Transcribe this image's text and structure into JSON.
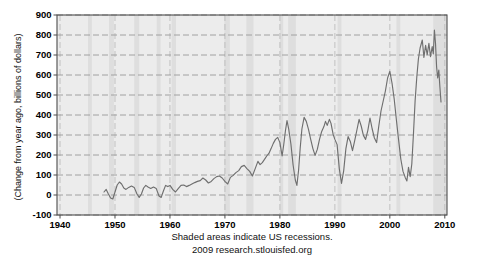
{
  "chart_data": {
    "type": "line",
    "title": "",
    "xlabel": "",
    "ylabel": "(Change from year ago, billions of dollars)",
    "note": "Shaded areas indicate US recessions.",
    "source": "2009 research.stlouisfed.org",
    "xlim": [
      1939.45,
      2010.4
    ],
    "ylim": [
      -100,
      900
    ],
    "x_ticks": [
      1940,
      1950,
      1960,
      1970,
      1980,
      1990,
      2000,
      2010
    ],
    "y_ticks": [
      -100,
      0,
      100,
      200,
      300,
      400,
      500,
      600,
      700,
      800,
      900
    ],
    "grid": "dashed horizontal and vertical at decades",
    "legend": "none",
    "colors": {
      "plot_bg": "#ececec",
      "recession_band": "#dedede",
      "h_gridline": "#9a9a9a",
      "v_gridline": "#bcbcbc",
      "frame": "#4d4d4d",
      "series": "#6f6f6f",
      "text": "#000000"
    },
    "recessions": [
      [
        1945.1,
        1945.8
      ],
      [
        1948.9,
        1949.8
      ],
      [
        1953.5,
        1954.4
      ],
      [
        1957.6,
        1958.3
      ],
      [
        1960.3,
        1961.1
      ],
      [
        1969.9,
        1970.9
      ],
      [
        1973.9,
        1975.2
      ],
      [
        1980.0,
        1980.6
      ],
      [
        1981.5,
        1982.9
      ],
      [
        1990.5,
        1991.2
      ],
      [
        2001.2,
        2001.9
      ],
      [
        2007.9,
        2010.4
      ]
    ],
    "series": [
      {
        "points": [
          [
            1948.0,
            15
          ],
          [
            1948.4,
            28
          ],
          [
            1948.8,
            5
          ],
          [
            1949.2,
            -15
          ],
          [
            1949.6,
            -20
          ],
          [
            1950.0,
            15
          ],
          [
            1950.4,
            50
          ],
          [
            1950.8,
            65
          ],
          [
            1951.2,
            55
          ],
          [
            1951.6,
            35
          ],
          [
            1952.0,
            28
          ],
          [
            1952.5,
            38
          ],
          [
            1953.0,
            45
          ],
          [
            1953.5,
            38
          ],
          [
            1954.0,
            5
          ],
          [
            1954.4,
            -12
          ],
          [
            1954.8,
            5
          ],
          [
            1955.2,
            35
          ],
          [
            1955.6,
            48
          ],
          [
            1956.0,
            40
          ],
          [
            1956.5,
            33
          ],
          [
            1957.0,
            40
          ],
          [
            1957.5,
            33
          ],
          [
            1958.0,
            -5
          ],
          [
            1958.4,
            -12
          ],
          [
            1958.8,
            20
          ],
          [
            1959.2,
            48
          ],
          [
            1959.6,
            42
          ],
          [
            1960.0,
            48
          ],
          [
            1960.5,
            28
          ],
          [
            1961.0,
            15
          ],
          [
            1961.5,
            32
          ],
          [
            1962.0,
            48
          ],
          [
            1962.5,
            50
          ],
          [
            1963.0,
            42
          ],
          [
            1963.5,
            48
          ],
          [
            1964.0,
            55
          ],
          [
            1964.5,
            62
          ],
          [
            1965.0,
            68
          ],
          [
            1965.5,
            72
          ],
          [
            1966.0,
            85
          ],
          [
            1966.5,
            75
          ],
          [
            1967.0,
            60
          ],
          [
            1967.5,
            68
          ],
          [
            1968.0,
            82
          ],
          [
            1968.5,
            92
          ],
          [
            1969.0,
            95
          ],
          [
            1969.5,
            85
          ],
          [
            1970.0,
            68
          ],
          [
            1970.5,
            55
          ],
          [
            1971.0,
            88
          ],
          [
            1971.5,
            98
          ],
          [
            1972.0,
            112
          ],
          [
            1972.5,
            122
          ],
          [
            1973.0,
            142
          ],
          [
            1973.5,
            148
          ],
          [
            1974.0,
            132
          ],
          [
            1974.5,
            118
          ],
          [
            1975.0,
            95
          ],
          [
            1975.5,
            132
          ],
          [
            1976.0,
            168
          ],
          [
            1976.4,
            152
          ],
          [
            1976.8,
            162
          ],
          [
            1977.2,
            178
          ],
          [
            1977.6,
            195
          ],
          [
            1978.0,
            208
          ],
          [
            1978.4,
            232
          ],
          [
            1978.8,
            258
          ],
          [
            1979.2,
            278
          ],
          [
            1979.6,
            288
          ],
          [
            1980.0,
            262
          ],
          [
            1980.4,
            195
          ],
          [
            1980.7,
            250
          ],
          [
            1981.0,
            320
          ],
          [
            1981.3,
            372
          ],
          [
            1981.6,
            330
          ],
          [
            1982.0,
            255
          ],
          [
            1982.4,
            150
          ],
          [
            1982.8,
            75
          ],
          [
            1983.1,
            48
          ],
          [
            1983.4,
            125
          ],
          [
            1983.7,
            235
          ],
          [
            1984.0,
            330
          ],
          [
            1984.4,
            388
          ],
          [
            1984.8,
            368
          ],
          [
            1985.2,
            328
          ],
          [
            1985.6,
            278
          ],
          [
            1986.0,
            232
          ],
          [
            1986.4,
            198
          ],
          [
            1986.8,
            228
          ],
          [
            1987.2,
            278
          ],
          [
            1987.6,
            318
          ],
          [
            1988.0,
            342
          ],
          [
            1988.3,
            368
          ],
          [
            1988.6,
            348
          ],
          [
            1989.0,
            378
          ],
          [
            1989.3,
            358
          ],
          [
            1989.7,
            302
          ],
          [
            1990.0,
            278
          ],
          [
            1990.4,
            252
          ],
          [
            1990.8,
            132
          ],
          [
            1991.2,
            58
          ],
          [
            1991.6,
            122
          ],
          [
            1992.0,
            232
          ],
          [
            1992.4,
            292
          ],
          [
            1992.8,
            268
          ],
          [
            1993.2,
            222
          ],
          [
            1993.6,
            272
          ],
          [
            1994.0,
            325
          ],
          [
            1994.4,
            378
          ],
          [
            1994.8,
            345
          ],
          [
            1995.2,
            298
          ],
          [
            1995.6,
            278
          ],
          [
            1996.0,
            322
          ],
          [
            1996.4,
            385
          ],
          [
            1996.8,
            330
          ],
          [
            1997.2,
            285
          ],
          [
            1997.6,
            262
          ],
          [
            1998.0,
            345
          ],
          [
            1998.4,
            420
          ],
          [
            1998.8,
            470
          ],
          [
            1999.2,
            520
          ],
          [
            1999.6,
            585
          ],
          [
            2000.0,
            618
          ],
          [
            2000.4,
            560
          ],
          [
            2000.8,
            480
          ],
          [
            2001.2,
            375
          ],
          [
            2001.6,
            275
          ],
          [
            2002.0,
            180
          ],
          [
            2002.4,
            118
          ],
          [
            2002.8,
            88
          ],
          [
            2003.1,
            70
          ],
          [
            2003.4,
            138
          ],
          [
            2003.7,
            92
          ],
          [
            2004.0,
            155
          ],
          [
            2004.3,
            310
          ],
          [
            2004.6,
            470
          ],
          [
            2004.9,
            590
          ],
          [
            2005.2,
            680
          ],
          [
            2005.5,
            735
          ],
          [
            2005.9,
            775
          ],
          [
            2006.2,
            688
          ],
          [
            2006.5,
            748
          ],
          [
            2006.8,
            702
          ],
          [
            2007.1,
            758
          ],
          [
            2007.4,
            692
          ],
          [
            2007.7,
            742
          ],
          [
            2007.9,
            705
          ],
          [
            2008.1,
            825
          ],
          [
            2008.3,
            758
          ],
          [
            2008.5,
            640
          ],
          [
            2008.7,
            585
          ],
          [
            2008.9,
            625
          ],
          [
            2009.1,
            540
          ],
          [
            2009.3,
            465
          ]
        ]
      }
    ],
    "plot_box": {
      "left": 57,
      "top": 15,
      "right": 447,
      "bottom": 215
    }
  }
}
